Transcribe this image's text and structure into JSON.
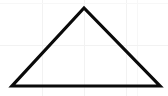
{
  "figure": {
    "background_color": "#ffffff",
    "width": 168,
    "height": 96
  },
  "shape": {
    "name": "triangle",
    "type": "isosceles-triangle",
    "stroke_color": "#0a0a0a",
    "stroke_width": 3.2,
    "fill": "none",
    "vertices": [
      {
        "label": "apex",
        "x": 84,
        "y": 8
      },
      {
        "label": "bottom-left",
        "x": 12,
        "y": 86
      },
      {
        "label": "bottom-right",
        "x": 160,
        "y": 86
      }
    ],
    "points_attr": "84,8 12,86 160,86"
  },
  "grid": {
    "visible": true,
    "color": "#f2f2f2",
    "faint_color": "#f7f7f7",
    "spacing": 42,
    "vertical_lines": [
      42,
      84,
      126
    ],
    "horizontal_lines": [
      45
    ],
    "faint_vertical_lines": [
      137
    ],
    "faint_horizontal_lines": [
      3
    ]
  }
}
